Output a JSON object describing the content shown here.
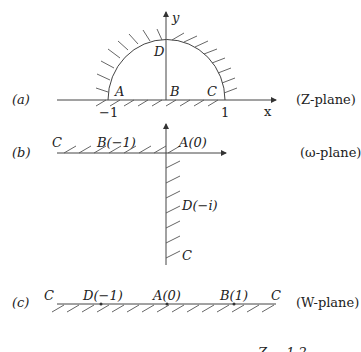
{
  "panels": {
    "a": {
      "tag": "(a)",
      "plane": "(Z-plane)",
      "axis_x": "x",
      "axis_y": "y",
      "points": {
        "A": "A",
        "B": "B",
        "C": "C",
        "D": "D"
      },
      "ticks": {
        "left": "−1",
        "right": "1"
      }
    },
    "b": {
      "tag": "(b)",
      "plane": "(ω-plane)",
      "points": {
        "C_left": "C",
        "B": "B(−1)",
        "A": "A(0)",
        "D": "D(−i)",
        "C_bottom": "C"
      }
    },
    "c": {
      "tag": "(c)",
      "plane": "(W-plane)",
      "points": {
        "C_left": "C",
        "D": "D(−1)",
        "A": "A(0)",
        "B": "B(1)",
        "C_right": "C"
      }
    }
  },
  "footer_fragment": "Z − 1  2"
}
